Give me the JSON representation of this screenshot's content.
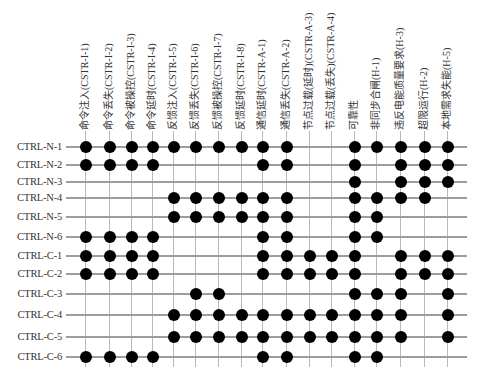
{
  "chart_data": {
    "type": "table",
    "title": "",
    "columns": [
      "命令注入(CSTR-I-1)",
      "命令丢失(CSTR-I-2)",
      "命令被操控(CSTR-I-3)",
      "命令延时(CSTR-I-4)",
      "反馈注入(CSTR-I-5)",
      "反馈丢失(CSTR-I-6)",
      "反馈被操控(CSTR-I-7)",
      "反馈延时(CSTR-I-8)",
      "通信延时(CSTR-A-1)",
      "通信丢失(CSTR-A-2)",
      "节点过载(延时)(CSTR-A-3)",
      "节点过载(丢失)(CSTR-A-4)",
      "可靠性",
      "非同步合闸(H-1)",
      "违反电能质量要求(H-3)",
      "超限运行(H-2)",
      "本地需求失能(H-5)"
    ],
    "rows": [
      {
        "label": "CTRL-N-1",
        "marks": [
          1,
          1,
          1,
          1,
          1,
          1,
          1,
          1,
          1,
          1,
          0,
          0,
          1,
          1,
          1,
          1,
          1
        ]
      },
      {
        "label": "CTRL-N-2",
        "marks": [
          1,
          1,
          1,
          1,
          0,
          0,
          0,
          0,
          1,
          1,
          0,
          0,
          1,
          0,
          1,
          1,
          1
        ]
      },
      {
        "label": "CTRL-N-3",
        "marks": [
          0,
          0,
          0,
          0,
          0,
          0,
          0,
          0,
          0,
          0,
          0,
          0,
          1,
          0,
          1,
          1,
          1
        ]
      },
      {
        "label": "CTRL-N-4",
        "marks": [
          0,
          0,
          0,
          0,
          1,
          1,
          1,
          1,
          1,
          1,
          0,
          0,
          1,
          1,
          1,
          1,
          0
        ]
      },
      {
        "label": "CTRL-N-5",
        "marks": [
          0,
          0,
          0,
          0,
          1,
          1,
          1,
          1,
          1,
          1,
          0,
          0,
          1,
          1,
          0,
          0,
          0
        ]
      },
      {
        "label": "CTRL-N-6",
        "marks": [
          1,
          1,
          1,
          1,
          0,
          0,
          0,
          0,
          1,
          1,
          0,
          0,
          1,
          1,
          0,
          0,
          0
        ]
      },
      {
        "label": "CTRL-C-1",
        "marks": [
          1,
          1,
          1,
          1,
          0,
          0,
          0,
          0,
          1,
          1,
          1,
          1,
          1,
          0,
          1,
          1,
          1
        ]
      },
      {
        "label": "CTRL-C-2",
        "marks": [
          1,
          1,
          1,
          1,
          0,
          0,
          0,
          0,
          1,
          1,
          1,
          1,
          1,
          0,
          1,
          1,
          1
        ]
      },
      {
        "label": "CTRL-C-3",
        "marks": [
          0,
          0,
          0,
          0,
          0,
          1,
          1,
          0,
          0,
          0,
          0,
          0,
          1,
          1,
          1,
          0,
          1
        ]
      },
      {
        "label": "CTRL-C-4",
        "marks": [
          0,
          0,
          0,
          0,
          1,
          1,
          1,
          1,
          1,
          1,
          1,
          1,
          1,
          1,
          1,
          0,
          1
        ]
      },
      {
        "label": "CTRL-C-5",
        "marks": [
          0,
          0,
          0,
          0,
          1,
          1,
          1,
          1,
          1,
          1,
          1,
          1,
          1,
          1,
          1,
          0,
          1
        ]
      },
      {
        "label": "CTRL-C-6",
        "marks": [
          1,
          1,
          1,
          1,
          0,
          0,
          0,
          0,
          1,
          1,
          0,
          0,
          1,
          1,
          0,
          0,
          0
        ]
      }
    ],
    "grid": true
  },
  "layout": {
    "col_x": [
      85,
      109,
      131,
      152,
      173,
      195,
      218,
      241,
      262,
      286,
      309,
      331,
      354,
      376,
      400,
      424,
      447
    ],
    "row_y": [
      147,
      165,
      182,
      198,
      217,
      237,
      256,
      274,
      294,
      315,
      337,
      357
    ],
    "colors": {
      "dot": "#000000",
      "row_line": "#9c9c9c",
      "col_line": "#b9b9b9",
      "text": "#333333"
    }
  }
}
